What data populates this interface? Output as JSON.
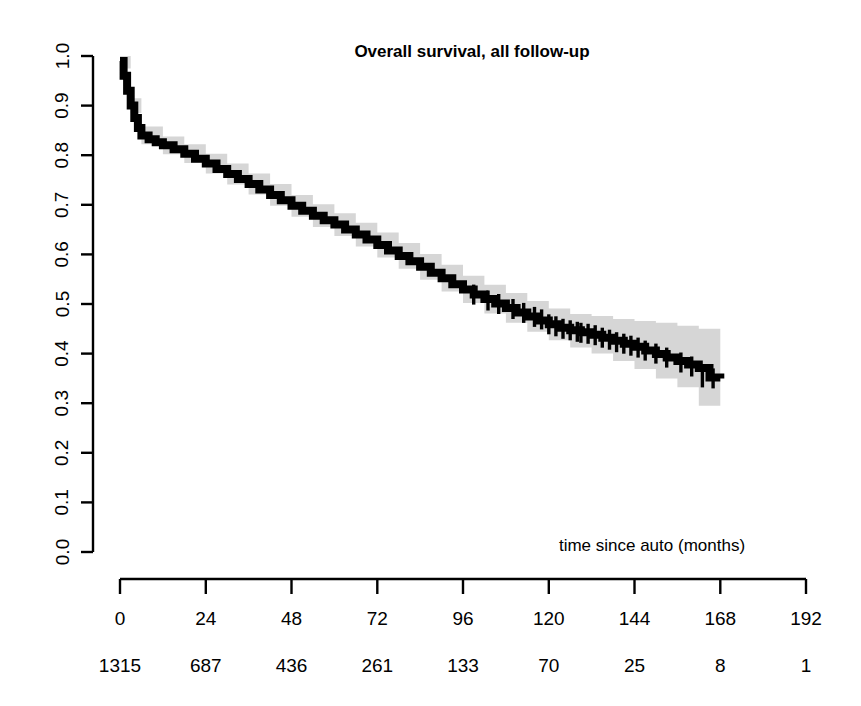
{
  "chart_data": {
    "type": "line",
    "title": "Overall survival, all follow-up",
    "xlabel": "time since auto (months)",
    "ylabel": "",
    "xlim": [
      0,
      192
    ],
    "ylim": [
      0,
      1
    ],
    "grid": false,
    "legend": "none",
    "x_ticks": [
      0,
      24,
      48,
      72,
      96,
      120,
      144,
      168,
      192
    ],
    "x_tick_labels": [
      "0",
      "24",
      "48",
      "72",
      "96",
      "120",
      "144",
      "168",
      "192"
    ],
    "y_ticks": [
      0.0,
      0.1,
      0.2,
      0.3,
      0.4,
      0.5,
      0.6,
      0.7,
      0.8,
      0.9,
      1.0
    ],
    "y_tick_labels": [
      "0.0",
      "0.1",
      "0.2",
      "0.3",
      "0.4",
      "0.5",
      "0.6",
      "0.7",
      "0.8",
      "0.9",
      "1.0"
    ],
    "number_at_risk_label": "",
    "number_at_risk": [
      1315,
      687,
      436,
      261,
      133,
      70,
      25,
      8,
      1
    ],
    "series": [
      {
        "name": "Overall survival",
        "type": "kaplan-meier-step",
        "color": "#000000",
        "x": [
          0,
          1,
          2,
          3,
          4,
          5,
          6,
          8,
          10,
          12,
          15,
          18,
          21,
          24,
          27,
          30,
          33,
          36,
          39,
          42,
          45,
          48,
          51,
          54,
          57,
          60,
          63,
          66,
          69,
          72,
          75,
          78,
          81,
          84,
          87,
          90,
          93,
          96,
          99,
          102,
          105,
          108,
          111,
          114,
          117,
          120,
          123,
          126,
          129,
          132,
          135,
          138,
          141,
          144,
          147,
          150,
          153,
          156,
          159,
          162,
          165,
          168
        ],
        "y": [
          0.99,
          0.96,
          0.93,
          0.9,
          0.875,
          0.855,
          0.84,
          0.832,
          0.826,
          0.82,
          0.812,
          0.803,
          0.793,
          0.783,
          0.772,
          0.762,
          0.752,
          0.742,
          0.731,
          0.72,
          0.709,
          0.698,
          0.688,
          0.678,
          0.669,
          0.66,
          0.65,
          0.64,
          0.63,
          0.619,
          0.608,
          0.597,
          0.586,
          0.575,
          0.563,
          0.552,
          0.54,
          0.529,
          0.519,
          0.51,
          0.501,
          0.492,
          0.483,
          0.475,
          0.467,
          0.459,
          0.452,
          0.447,
          0.443,
          0.438,
          0.432,
          0.426,
          0.42,
          0.414,
          0.406,
          0.399,
          0.392,
          0.385,
          0.378,
          0.371,
          0.352,
          0.35
        ]
      },
      {
        "name": "95% CI upper",
        "type": "band-upper",
        "color": "#d6d6d6",
        "x": [
          0,
          3,
          6,
          12,
          18,
          24,
          30,
          36,
          42,
          48,
          54,
          60,
          66,
          72,
          78,
          84,
          90,
          96,
          102,
          108,
          114,
          120,
          126,
          132,
          138,
          144,
          150,
          156,
          162,
          168
        ],
        "y": [
          1.0,
          0.915,
          0.858,
          0.838,
          0.822,
          0.803,
          0.783,
          0.763,
          0.742,
          0.72,
          0.701,
          0.683,
          0.664,
          0.644,
          0.623,
          0.601,
          0.579,
          0.557,
          0.539,
          0.522,
          0.506,
          0.491,
          0.48,
          0.476,
          0.47,
          0.466,
          0.462,
          0.456,
          0.45,
          0.445
        ]
      },
      {
        "name": "95% CI lower",
        "type": "band-lower",
        "color": "#d6d6d6",
        "x": [
          0,
          3,
          6,
          12,
          18,
          24,
          30,
          36,
          42,
          48,
          54,
          60,
          66,
          72,
          78,
          84,
          90,
          96,
          102,
          108,
          114,
          120,
          126,
          132,
          138,
          144,
          150,
          156,
          162,
          168
        ],
        "y": [
          0.975,
          0.885,
          0.822,
          0.802,
          0.784,
          0.763,
          0.741,
          0.721,
          0.698,
          0.676,
          0.655,
          0.637,
          0.616,
          0.594,
          0.571,
          0.549,
          0.525,
          0.502,
          0.481,
          0.462,
          0.444,
          0.427,
          0.412,
          0.4,
          0.385,
          0.369,
          0.35,
          0.332,
          0.295,
          0.262
        ]
      }
    ],
    "censor_marks": {
      "description": "vertical tick marks indicating censored observations",
      "x": [
        99,
        103,
        106,
        110,
        113,
        116,
        118,
        120,
        122,
        124,
        126,
        128,
        129,
        131,
        133,
        135,
        137,
        139,
        141,
        143,
        145,
        147,
        150,
        153,
        157,
        160,
        163,
        166
      ],
      "y": [
        0.519,
        0.507,
        0.5,
        0.49,
        0.482,
        0.474,
        0.469,
        0.459,
        0.455,
        0.45,
        0.447,
        0.444,
        0.442,
        0.44,
        0.437,
        0.432,
        0.428,
        0.423,
        0.42,
        0.416,
        0.412,
        0.406,
        0.4,
        0.392,
        0.382,
        0.374,
        0.352,
        0.35
      ]
    }
  },
  "figure": {
    "background_color": "#ffffff",
    "curve_color": "#000000",
    "band_color": "#d6d6d6"
  }
}
